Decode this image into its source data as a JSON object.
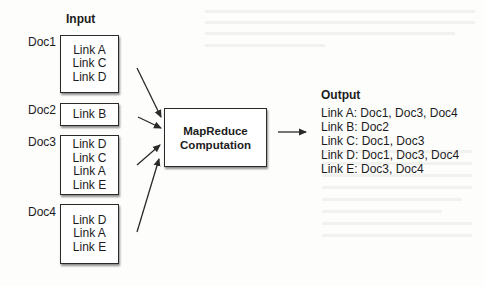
{
  "input": {
    "title": "Input",
    "docs": [
      {
        "label": "Doc1",
        "links": [
          "Link A",
          "Link C",
          "Link D"
        ]
      },
      {
        "label": "Doc2",
        "links": [
          "Link B"
        ]
      },
      {
        "label": "Doc3",
        "links": [
          "Link D",
          "Link C",
          "Link A",
          "Link E"
        ]
      },
      {
        "label": "Doc4",
        "links": [
          "Link D",
          "Link A",
          "Link E"
        ]
      }
    ]
  },
  "process": {
    "line1": "MapReduce",
    "line2": "Computation"
  },
  "output": {
    "title": "Output",
    "lines": [
      "Link A: Doc1, Doc3, Doc4",
      "Link B: Doc2",
      "Link C: Doc1, Doc3",
      "Link D: Doc1, Doc3, Doc4",
      "Link E: Doc3, Doc4"
    ]
  },
  "colors": {
    "stroke": "#2a2a2a",
    "background": "#fdfdfc"
  }
}
